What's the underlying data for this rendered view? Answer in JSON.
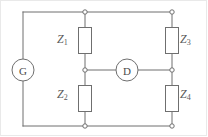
{
  "figure": {
    "kind": "circuit-diagram",
    "name": "Wheatstone bridge",
    "width": 208,
    "height": 137,
    "background": "#ffffff",
    "border_color": "#e9e9e9",
    "line_color": "#6f6f6f",
    "text_color": "#5a5a5a"
  },
  "meters": {
    "generator": {
      "label": "G",
      "cx": 23,
      "cy": 70,
      "r": 11
    },
    "detector": {
      "label": "D",
      "cx": 127,
      "cy": 70,
      "r": 11
    }
  },
  "impedances": [
    {
      "id": "z1",
      "base": "Z",
      "sub": "1",
      "text": "Z1",
      "position": "top-left-branch"
    },
    {
      "id": "z2",
      "base": "Z",
      "sub": "2",
      "text": "Z2",
      "position": "bottom-left-branch"
    },
    {
      "id": "z3",
      "base": "Z",
      "sub": "3",
      "text": "Z3",
      "position": "top-right-branch"
    },
    {
      "id": "z4",
      "base": "Z",
      "sub": "4",
      "text": "Z4",
      "position": "bottom-right-branch"
    }
  ],
  "nodes": [
    {
      "id": "top-left-corner",
      "x": 23,
      "y": 12
    },
    {
      "id": "top-mid-node",
      "x": 85,
      "y": 12
    },
    {
      "id": "top-right-node",
      "x": 172,
      "y": 12
    },
    {
      "id": "mid-left-node",
      "x": 85,
      "y": 70
    },
    {
      "id": "mid-right-node",
      "x": 172,
      "y": 70
    },
    {
      "id": "bottom-mid-node",
      "x": 85,
      "y": 126
    },
    {
      "id": "bottom-right-node",
      "x": 172,
      "y": 126
    },
    {
      "id": "bottom-left-corner",
      "x": 23,
      "y": 126
    }
  ]
}
